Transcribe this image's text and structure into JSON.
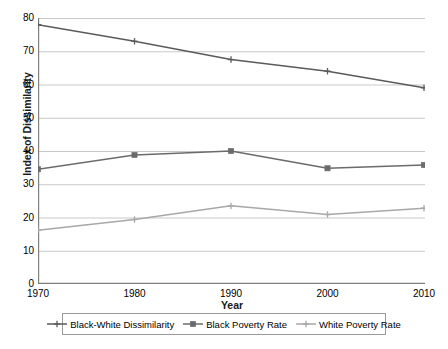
{
  "chart_data": {
    "type": "line",
    "title": "",
    "xlabel": "Year",
    "ylabel": "Index of Dissimilarity",
    "x": [
      1970,
      1980,
      1990,
      2000,
      2010
    ],
    "xticklabels": [
      "1970",
      "1980",
      "1990",
      "2000",
      "2010"
    ],
    "yticklabels": [
      "0",
      "10",
      "20",
      "30",
      "40",
      "50",
      "60",
      "70",
      "80"
    ],
    "ylim": [
      0,
      80
    ],
    "ytick_step": 10,
    "xlim": [
      1970,
      2010
    ],
    "grid": "horizontal",
    "legend_position": "bottom",
    "series": [
      {
        "name": "Black-White Dissimilarity",
        "color": "#5a5a5a",
        "marker": "plus",
        "values": [
          78,
          73,
          67.5,
          64,
          59
        ]
      },
      {
        "name": "Black Poverty Rate",
        "color": "#6b6b6b",
        "marker": "square",
        "values": [
          34.5,
          38.8,
          40,
          34.8,
          35.8
        ]
      },
      {
        "name": "White Poverty Rate",
        "color": "#a8a8a8",
        "marker": "plus",
        "values": [
          16.2,
          19.4,
          23.5,
          20.9,
          22.8
        ]
      }
    ]
  },
  "axes": {
    "y_title": "Index of Dissimilarity",
    "x_title": "Year"
  },
  "legend": {
    "entries": [
      {
        "label": "Black-White Dissimilarity"
      },
      {
        "label": "Black Poverty Rate"
      },
      {
        "label": "White Poverty Rate"
      }
    ]
  },
  "colors": {
    "gridline": "#c9c9c9",
    "axis": "#808080",
    "series_dark": "#5a5a5a",
    "series_mid": "#6b6b6b",
    "series_light": "#a8a8a8",
    "background": "#ffffff"
  }
}
